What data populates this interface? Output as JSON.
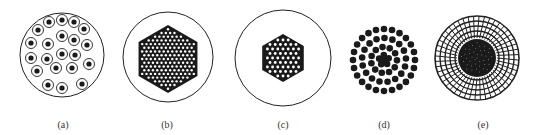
{
  "figure": {
    "panels": [
      {
        "id": "a",
        "label": "(a)",
        "description": "Circle containing ~23 separate ringed cells (dot inside ring), loosely packed",
        "cx": 62,
        "cy": 55,
        "r": 42,
        "label_x": 63
      },
      {
        "id": "b",
        "label": "(b)",
        "description": "Circle containing a dense hexagonal close-packed cluster of many small hollow circles",
        "cx": 168,
        "cy": 57,
        "r": 45,
        "label_x": 167
      },
      {
        "id": "c",
        "label": "(c)",
        "description": "Circle containing a smaller hexagonal cluster of hollow circles",
        "cx": 283,
        "cy": 58,
        "r": 48,
        "label_x": 283
      },
      {
        "id": "d",
        "label": "(d)",
        "description": "Loose concentric ring arrangement of solid dots, denser toward center",
        "cx": 384,
        "cy": 60,
        "r": 33,
        "label_x": 384
      },
      {
        "id": "e",
        "label": "(e)",
        "description": "Concentric ring mesh pattern with dark dense core",
        "cx": 477,
        "cy": 58,
        "r": 42,
        "label_x": 483
      }
    ],
    "colors": {
      "stroke": "#222222",
      "fill": "#1a1a1a",
      "background": "#ffffff"
    }
  }
}
